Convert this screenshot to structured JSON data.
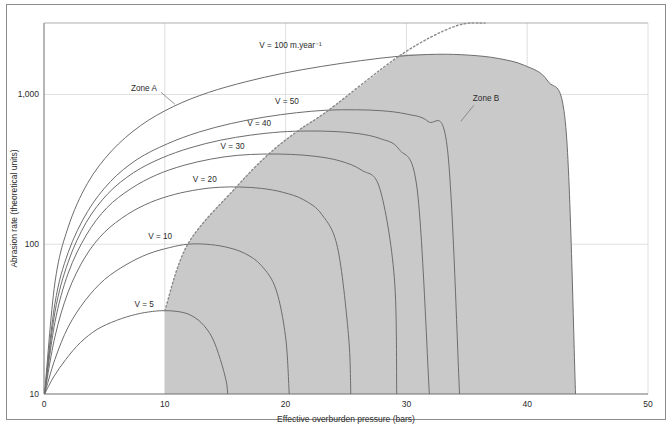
{
  "figure": {
    "caption": ""
  },
  "chart_data": {
    "type": "line",
    "title": "",
    "xlabel": "Effective overburden pressure (bars)",
    "ylabel": "Abrasion rate (theoretical units)",
    "xlim": [
      0,
      50
    ],
    "ylim": [
      10,
      3000
    ],
    "yscale": "log",
    "xscale": "linear",
    "xticks": [
      0,
      10,
      20,
      30,
      40,
      50
    ],
    "xticklabels": [
      "0",
      "10",
      "20",
      "30",
      "40",
      "50"
    ],
    "yticks": [
      10,
      100,
      1000
    ],
    "yticklabels": [
      "10",
      "100",
      "1,000"
    ],
    "grid": true,
    "grid_color": "#d8d8d8",
    "axis_color": "#6f6f6f",
    "curve_color": "#6d6d6d",
    "zone_b_fill": "#c9c9c9",
    "divider_style": "dotted",
    "legend_position": "inline-labels",
    "annotations": [
      {
        "name": "zone-a",
        "label": "Zone A",
        "x": 7.2,
        "y": 1050
      },
      {
        "name": "zone-b",
        "label": "Zone B",
        "x": 35.5,
        "y": 900
      }
    ],
    "series": [
      {
        "name": "V = 5",
        "label": "V = 5",
        "velocity": 5,
        "label_x": 9.1,
        "label_y": 38,
        "peak_x": 10.0,
        "peak_y": 36,
        "end_x": 15.2,
        "points": [
          [
            0.05,
            10
          ],
          [
            0.8,
            13
          ],
          [
            1.8,
            17
          ],
          [
            3.0,
            22
          ],
          [
            4.4,
            27
          ],
          [
            6.0,
            31
          ],
          [
            7.6,
            34
          ],
          [
            9.0,
            35.6
          ],
          [
            10.0,
            36
          ],
          [
            11.0,
            35.6
          ],
          [
            12.0,
            34
          ],
          [
            13.0,
            30
          ],
          [
            13.9,
            24
          ],
          [
            14.6,
            17
          ],
          [
            15.1,
            12
          ],
          [
            15.2,
            10
          ]
        ]
      },
      {
        "name": "V = 10",
        "label": "V = 10",
        "velocity": 10,
        "label_x": 10.6,
        "label_y": 108,
        "peak_x": 11.9,
        "peak_y": 100,
        "end_x": 20.3,
        "points": [
          [
            0.05,
            10
          ],
          [
            0.9,
            17
          ],
          [
            2.0,
            28
          ],
          [
            3.4,
            42
          ],
          [
            5.0,
            58
          ],
          [
            6.8,
            73
          ],
          [
            8.6,
            86
          ],
          [
            10.4,
            95
          ],
          [
            11.9,
            100
          ],
          [
            13.4,
            100
          ],
          [
            15.0,
            96
          ],
          [
            16.6,
            87
          ],
          [
            18.0,
            72
          ],
          [
            19.2,
            50
          ],
          [
            20.0,
            24
          ],
          [
            20.3,
            10
          ]
        ]
      },
      {
        "name": "V = 20",
        "label": "V = 20",
        "velocity": 20,
        "label_x": 14.3,
        "label_y": 260,
        "peak_x": 15.9,
        "peak_y": 240,
        "end_x": 25.4,
        "points": [
          [
            0.05,
            10
          ],
          [
            0.9,
            24
          ],
          [
            2.0,
            48
          ],
          [
            3.4,
            82
          ],
          [
            5.0,
            120
          ],
          [
            6.9,
            158
          ],
          [
            8.8,
            190
          ],
          [
            10.8,
            215
          ],
          [
            12.8,
            232
          ],
          [
            14.5,
            240
          ],
          [
            16.2,
            241
          ],
          [
            18.0,
            236
          ],
          [
            19.8,
            222
          ],
          [
            21.5,
            198
          ],
          [
            23.0,
            158
          ],
          [
            24.3,
            95
          ],
          [
            25.2,
            25
          ],
          [
            25.4,
            10
          ]
        ]
      },
      {
        "name": "V = 30",
        "label": "V = 30",
        "velocity": 30,
        "label_x": 16.6,
        "label_y": 430,
        "peak_x": 18.6,
        "peak_y": 400,
        "end_x": 29.2,
        "points": [
          [
            0.05,
            10
          ],
          [
            0.9,
            30
          ],
          [
            2.0,
            64
          ],
          [
            3.5,
            115
          ],
          [
            5.2,
            175
          ],
          [
            7.2,
            235
          ],
          [
            9.3,
            290
          ],
          [
            11.5,
            335
          ],
          [
            13.8,
            370
          ],
          [
            16.0,
            392
          ],
          [
            18.2,
            400
          ],
          [
            20.4,
            398
          ],
          [
            22.5,
            386
          ],
          [
            24.5,
            360
          ],
          [
            26.3,
            312
          ],
          [
            27.8,
            235
          ],
          [
            29.0,
            60
          ],
          [
            29.2,
            10
          ]
        ]
      },
      {
        "name": "V = 40",
        "label": "V = 40",
        "velocity": 40,
        "label_x": 18.8,
        "label_y": 620,
        "peak_x": 21.0,
        "peak_y": 570,
        "end_x": 31.9,
        "points": [
          [
            0.05,
            10
          ],
          [
            0.9,
            35
          ],
          [
            2.0,
            76
          ],
          [
            3.5,
            140
          ],
          [
            5.3,
            218
          ],
          [
            7.4,
            300
          ],
          [
            9.7,
            375
          ],
          [
            12.1,
            440
          ],
          [
            14.6,
            495
          ],
          [
            17.1,
            535
          ],
          [
            19.6,
            562
          ],
          [
            21.8,
            570
          ],
          [
            24.0,
            566
          ],
          [
            26.0,
            548
          ],
          [
            27.8,
            508
          ],
          [
            29.4,
            430
          ],
          [
            30.9,
            230
          ],
          [
            31.9,
            10
          ]
        ]
      },
      {
        "name": "V = 50",
        "label": "V = 50",
        "velocity": 50,
        "label_x": 21.1,
        "label_y": 860,
        "peak_x": 23.6,
        "peak_y": 790,
        "end_x": 34.4,
        "points": [
          [
            0.05,
            10
          ],
          [
            0.9,
            40
          ],
          [
            2.0,
            88
          ],
          [
            3.6,
            165
          ],
          [
            5.5,
            262
          ],
          [
            7.7,
            368
          ],
          [
            10.2,
            468
          ],
          [
            12.8,
            560
          ],
          [
            15.5,
            640
          ],
          [
            18.2,
            705
          ],
          [
            20.9,
            755
          ],
          [
            23.4,
            785
          ],
          [
            25.8,
            790
          ],
          [
            28.0,
            778
          ],
          [
            30.0,
            740
          ],
          [
            31.8,
            660
          ],
          [
            33.4,
            430
          ],
          [
            34.4,
            10
          ]
        ]
      },
      {
        "name": "V = 100",
        "label": "V = 100 m.year⁻¹",
        "velocity": 100,
        "label_x": 23.0,
        "label_y": 2050,
        "peak_x": 29.6,
        "peak_y": 1850,
        "end_x": 44.0,
        "points": [
          [
            0.05,
            10
          ],
          [
            0.9,
            55
          ],
          [
            2.0,
            130
          ],
          [
            3.6,
            255
          ],
          [
            5.6,
            420
          ],
          [
            8.0,
            620
          ],
          [
            10.7,
            830
          ],
          [
            13.6,
            1030
          ],
          [
            16.7,
            1215
          ],
          [
            19.8,
            1385
          ],
          [
            23.0,
            1540
          ],
          [
            26.2,
            1680
          ],
          [
            29.4,
            1800
          ],
          [
            32.5,
            1855
          ],
          [
            35.2,
            1830
          ],
          [
            37.6,
            1740
          ],
          [
            39.8,
            1560
          ],
          [
            41.7,
            1230
          ],
          [
            43.2,
            600
          ],
          [
            44.0,
            10
          ]
        ]
      }
    ],
    "divider": {
      "name": "zone-divider",
      "description": "dotted locus through curve peaks separating Zone A and Zone B",
      "points": [
        [
          10.0,
          36
        ],
        [
          11.9,
          100
        ],
        [
          15.9,
          240
        ],
        [
          18.6,
          400
        ],
        [
          21.0,
          570
        ],
        [
          23.6,
          790
        ],
        [
          29.6,
          1850
        ],
        [
          34.0,
          2850
        ]
      ]
    }
  }
}
